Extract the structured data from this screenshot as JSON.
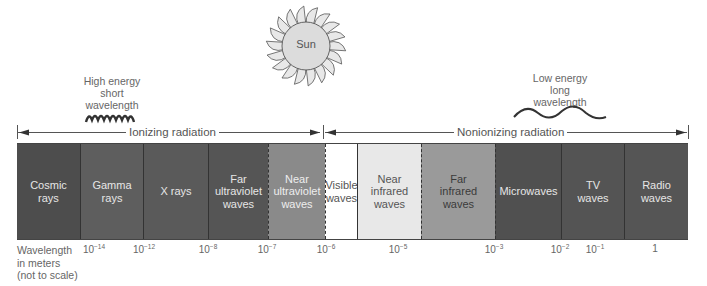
{
  "sun": {
    "label": "Sun"
  },
  "notes": {
    "high_energy": [
      "High energy",
      "short",
      "wavelength"
    ],
    "low_energy": [
      "Low energy",
      "long",
      "wavelength"
    ]
  },
  "ranges": {
    "ionizing": "Ionizing radiation",
    "nonionizing": "Nonionizing radiation"
  },
  "segments": [
    {
      "label": [
        "Cosmic",
        "rays"
      ],
      "color": "#4d4d4d",
      "text": "#e6e6e6",
      "width": 63
    },
    {
      "label": [
        "Gamma",
        "rays"
      ],
      "color": "#5e5e5e",
      "text": "#e6e6e6",
      "width": 63
    },
    {
      "label": [
        "X rays"
      ],
      "color": "#5a5a5a",
      "text": "#e6e6e6",
      "width": 65
    },
    {
      "label": [
        "Far",
        "ultraviolet",
        "waves"
      ],
      "color": "#555555",
      "text": "#e6e6e6",
      "width": 60
    },
    {
      "label": [
        "Near",
        "ultraviolet",
        "waves"
      ],
      "color": "#8a8a8a",
      "text": "#eeeeee",
      "width": 57
    },
    {
      "label": [
        "Visible",
        "waves"
      ],
      "color": "#ffffff",
      "text": "#555555",
      "width": 32
    },
    {
      "label": [
        "Near",
        "infrared",
        "waves"
      ],
      "color": "#e8e8e8",
      "text": "#555555",
      "width": 64
    },
    {
      "label": [
        "Far",
        "infrared",
        "waves"
      ],
      "color": "#9a9a9a",
      "text": "#3a3a3a",
      "width": 74
    },
    {
      "label": [
        "Microwaves"
      ],
      "color": "#505050",
      "text": "#e6e6e6",
      "width": 66
    },
    {
      "label": [
        "TV",
        "waves"
      ],
      "color": "#545454",
      "text": "#e6e6e6",
      "width": 63
    },
    {
      "label": [
        "Radio",
        "waves"
      ],
      "color": "#555555",
      "text": "#e6e6e6",
      "width": 64
    }
  ],
  "axis": {
    "label": [
      "Wavelength",
      "in meters",
      "(not to scale)"
    ],
    "ticks": [
      {
        "base": "10",
        "exp": "−14",
        "x": 94
      },
      {
        "base": "10",
        "exp": "−12",
        "x": 144
      },
      {
        "base": "10",
        "exp": "−8",
        "x": 208
      },
      {
        "base": "10",
        "exp": "−7",
        "x": 267
      },
      {
        "base": "10",
        "exp": "−6",
        "x": 326
      },
      {
        "base": "10",
        "exp": "−5",
        "x": 398
      },
      {
        "base": "10",
        "exp": "−3",
        "x": 494
      },
      {
        "base": "10",
        "exp": "−2",
        "x": 560
      },
      {
        "base": "10",
        "exp": "−1",
        "x": 595
      },
      {
        "base": "1",
        "exp": "",
        "x": 655
      }
    ]
  }
}
